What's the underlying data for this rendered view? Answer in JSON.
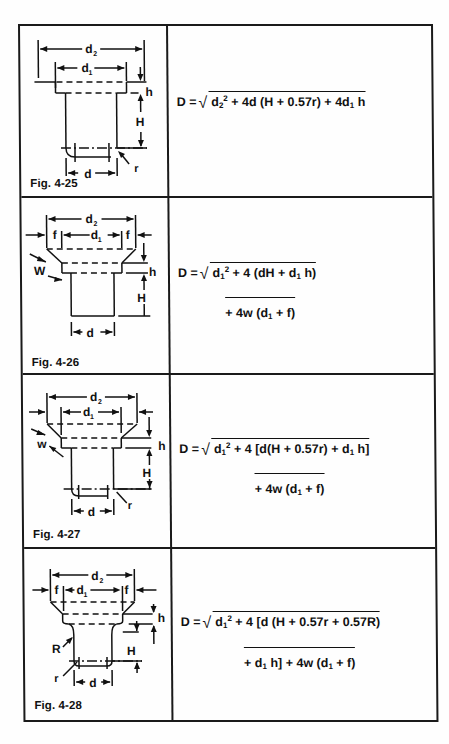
{
  "table": {
    "rows": [
      {
        "figure_label": "Fig. 4-25",
        "diagram_labels": {
          "d2": "d",
          "d2_sub": "2",
          "d1": "d",
          "d1_sub": "1",
          "h": "h",
          "H": "H",
          "d": "d",
          "r": "r"
        },
        "formula": {
          "lhs": "D =",
          "line1": "d₂² + 4d (H + 0.57r) + 4d₁ h",
          "line1_parts": {
            "a": "d",
            "a_sub": "2",
            "a_sup": "2",
            "b": " + 4d (H + 0.57r) + 4d",
            "b_sub": "1",
            "c": " h"
          }
        }
      },
      {
        "figure_label": "Fig. 4-26",
        "diagram_labels": {
          "d2": "d",
          "d2_sub": "2",
          "d1": "d",
          "d1_sub": "1",
          "f": "f",
          "W": "W",
          "h": "h",
          "H": "H",
          "d": "d"
        },
        "formula": {
          "lhs": "D =",
          "line1": "d₁² + 4 (dH + d₁ h)",
          "line2": "+ 4w (d₁ + f)",
          "line1_parts": {
            "a": "d",
            "a_sub": "1",
            "a_sup": "2",
            "b": " + 4 (dH + d",
            "b_sub": "1",
            "c": " h)"
          },
          "line2_parts": {
            "a": "+ 4w (d",
            "a_sub": "1",
            "b": " + f)"
          }
        }
      },
      {
        "figure_label": "Fig. 4-27",
        "diagram_labels": {
          "d2": "d",
          "d2_sub": "2",
          "d1": "d",
          "d1_sub": "1",
          "w": "w",
          "h": "h",
          "H": "H",
          "d": "d",
          "r": "r"
        },
        "formula": {
          "lhs": "D =",
          "line1": "d₁² + 4 [d(H + 0.57r) + d₁ h]",
          "line2": "+ 4w (d₁ + f)",
          "line1_parts": {
            "a": "d",
            "a_sub": "1",
            "a_sup": "2",
            "b": " + 4 [d(H + 0.57r) + d",
            "b_sub": "1",
            "c": " h]"
          },
          "line2_parts": {
            "a": "+ 4w (d",
            "a_sub": "1",
            "b": " + f)"
          }
        }
      },
      {
        "figure_label": "Fig. 4-28",
        "diagram_labels": {
          "d2": "d",
          "d2_sub": "2",
          "d1": "d",
          "d1_sub": "1",
          "f": "f",
          "R": "R",
          "r": "r",
          "h": "h",
          "H": "H",
          "d": "d"
        },
        "formula": {
          "lhs": "D =",
          "line1": "d₁² + 4 [d (H + 0.57r + 0.57R)",
          "line2": "+ d₁ h] + 4w (d₁ + f)",
          "line1_parts": {
            "a": "d",
            "a_sub": "1",
            "a_sup": "2",
            "b": " + 4 [d (H + 0.57r + 0.57R)"
          },
          "line2_parts": {
            "a": "+ d",
            "a_sub": "1",
            "b": " h] + 4w (d",
            "b_sub": "1",
            "c": " + f)"
          }
        }
      }
    ]
  },
  "colors": {
    "ink": "#111111",
    "paper": "#fefefe"
  }
}
